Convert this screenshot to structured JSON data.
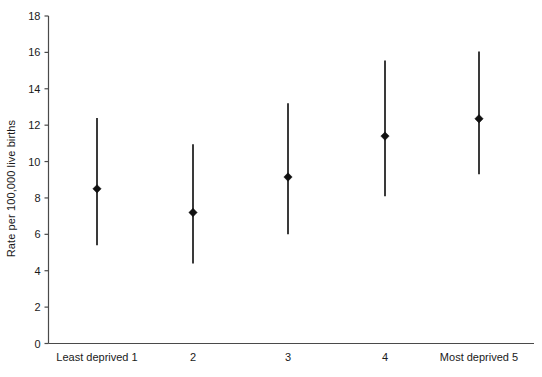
{
  "chart_data": {
    "type": "scatter",
    "title": "",
    "subtitle": "",
    "xlabel": "",
    "ylabel": "Rate per 100,000 live births",
    "ylim": [
      0,
      18
    ],
    "yticks": [
      0,
      2,
      4,
      6,
      8,
      10,
      12,
      14,
      16,
      18
    ],
    "ytick_labels": [
      "0",
      "2",
      "4",
      "6",
      "8",
      "10",
      "12",
      "14",
      "16",
      "18"
    ],
    "grid": false,
    "legend": null,
    "categories": [
      "Least deprived 1",
      "2",
      "3",
      "4",
      "Most deprived 5"
    ],
    "values": [
      8.5,
      7.2,
      9.15,
      11.4,
      12.35
    ],
    "ci_lower": [
      5.4,
      4.4,
      6.0,
      8.1,
      9.3
    ],
    "ci_upper": [
      12.4,
      10.95,
      13.2,
      15.55,
      16.05
    ],
    "series": [
      {
        "name": "Rate with 95% confidence interval",
        "values": [
          8.5,
          7.2,
          9.15,
          11.4,
          12.35
        ],
        "ci_lower": [
          5.4,
          4.4,
          6.0,
          8.1,
          9.3
        ],
        "ci_upper": [
          12.4,
          10.95,
          13.2,
          15.55,
          16.05
        ]
      }
    ],
    "marker": "diamond",
    "colors": {
      "marker": "#111111",
      "errorbar": "#3a3a3a",
      "axis": "#4a4a4a",
      "background": "#ffffff"
    }
  }
}
